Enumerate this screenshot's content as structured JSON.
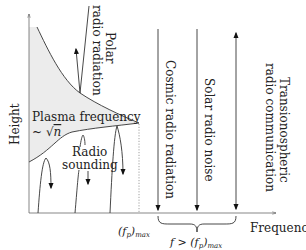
{
  "diagram": {
    "axes": {
      "y_label": "Height",
      "x_label": "Frequency",
      "x_marker": "(f",
      "x_marker_sub": "p",
      "x_marker_tail": ")",
      "x_marker_sub2": "max",
      "brace_label_prefix": "f > (f",
      "brace_label_sub": "p",
      "brace_label_tail": ")",
      "brace_label_sub2": "max"
    },
    "region": {
      "label_line1": "Plasma frequency",
      "label_line2_prefix": "~ ",
      "label_line2_sqrt": "√",
      "label_line2_var": "n",
      "fill_color": "#ececec"
    },
    "labels": {
      "polar_line1": "Polar",
      "polar_line2": "radio radiation",
      "sounding_line1": "Radio",
      "sounding_line2": "sounding",
      "cosmic": "Cosmic radio radiation",
      "solar": "Solar radio noise",
      "trans_line1": "Transionospheric",
      "trans_line2": "radio communication"
    },
    "colors": {
      "line": "#333333",
      "text": "#222222"
    }
  }
}
